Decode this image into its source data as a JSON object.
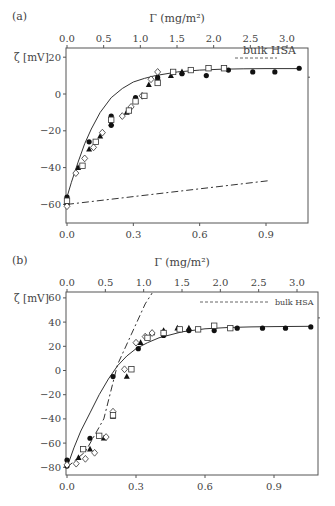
{
  "chart_data": [
    {
      "panel": "(a)",
      "type": "scatter",
      "xlabel_bottom": "",
      "xlabel_top": "Γ (mg/m²)",
      "ylabel": "ζ [mV]",
      "x_bottom_ticks": [
        "0.0",
        "0.3",
        "0.6",
        "0.9"
      ],
      "x_bottom_values": [
        0.0,
        0.3,
        0.6,
        0.9
      ],
      "x_top_ticks": [
        "0.0",
        "0.5",
        "1.0",
        "1.5",
        "2.0",
        "2.5",
        "3.0"
      ],
      "x_top_values": [
        0.0,
        0.5,
        1.0,
        1.5,
        2.0,
        2.5,
        3.0
      ],
      "y_ticks": [
        "20",
        "0",
        "−20",
        "−40",
        "−60"
      ],
      "y_values": [
        20,
        0,
        -20,
        -40,
        -60
      ],
      "xlim_bottom": [
        0,
        1.09
      ],
      "xlim_top": [
        0,
        3.3
      ],
      "ylim": [
        -70,
        25
      ],
      "legend": [
        {
          "label": "bulk HSA",
          "style": "dashed"
        }
      ],
      "series": [
        {
          "name": "filled-circle",
          "marker": "filled-circle",
          "x": [
            0.0,
            0.1,
            0.2,
            0.2,
            0.31,
            0.41,
            0.52,
            0.63,
            0.73,
            0.84,
            0.94,
            1.05
          ],
          "y": [
            -56,
            -26,
            -12,
            -17,
            -2,
            9,
            11,
            10,
            13,
            12,
            12,
            14
          ]
        },
        {
          "name": "filled-triangle",
          "marker": "filled-triangle",
          "x": [
            0.0,
            0.05,
            0.1,
            0.15,
            0.2,
            0.27,
            0.31,
            0.37,
            0.41,
            0.47,
            0.52
          ],
          "y": [
            -59,
            -40,
            -30,
            -23,
            -16,
            -10,
            -4,
            5,
            9,
            10,
            12
          ]
        },
        {
          "name": "open-diamond",
          "marker": "open-diamond",
          "x": [
            0.0,
            0.04,
            0.08,
            0.12,
            0.16,
            0.25,
            0.29,
            0.34,
            0.38,
            0.41
          ],
          "y": [
            -61,
            -43,
            -35,
            -29,
            -21,
            -12,
            -7,
            -1,
            8,
            12
          ]
        },
        {
          "name": "open-square",
          "marker": "open-square",
          "x": [
            0.0,
            0.07,
            0.13,
            0.2,
            0.28,
            0.31,
            0.35,
            0.41,
            0.48,
            0.56,
            0.64,
            0.71
          ],
          "y": [
            -58,
            -39,
            -26,
            -14,
            -9,
            -4,
            -1,
            6,
            12,
            13,
            14,
            14
          ]
        }
      ],
      "lines": [
        {
          "name": "model-fit",
          "style": "solid",
          "x": [
            0.0,
            0.02,
            0.05,
            0.08,
            0.11,
            0.15,
            0.2,
            0.25,
            0.3,
            0.35,
            0.4,
            0.5,
            0.6,
            0.7,
            0.8,
            0.9,
            1.05
          ],
          "y": [
            -56,
            -48,
            -37,
            -27,
            -19,
            -10,
            -2,
            3,
            6.5,
            8.5,
            10,
            12,
            13,
            13.5,
            13.7,
            13.8,
            13.8
          ]
        },
        {
          "name": "bulk-HSA-reference",
          "style": "dash-dot",
          "x": [
            0.0,
            0.92
          ],
          "y": [
            -60,
            -47
          ]
        }
      ]
    },
    {
      "panel": "(b)",
      "type": "scatter",
      "xlabel_top": "Γ (mg/m²)",
      "ylabel": "ζ [mV]",
      "x_bottom_ticks": [
        "0.0",
        "0.3",
        "0.6",
        "0.9"
      ],
      "x_bottom_values": [
        0.0,
        0.3,
        0.6,
        0.9
      ],
      "x_top_ticks": [
        "0.0",
        "0.5",
        "1.0",
        "1.5",
        "2.0",
        "2.5",
        "3.0"
      ],
      "x_top_values": [
        0.0,
        0.5,
        1.0,
        1.5,
        2.0,
        2.5,
        3.0
      ],
      "y_ticks": [
        "60",
        "40",
        "20",
        "0",
        "−20",
        "−40",
        "−60",
        "−80"
      ],
      "y_values": [
        60,
        40,
        20,
        0,
        -20,
        -40,
        -60,
        -80
      ],
      "xlim_bottom": [
        0,
        1.09
      ],
      "xlim_top": [
        0,
        3.3
      ],
      "ylim": [
        -87,
        65
      ],
      "legend": [
        {
          "label": "bulk HSA",
          "style": "dashed"
        }
      ],
      "series": [
        {
          "name": "filled-circle",
          "marker": "filled-circle",
          "x": [
            0.0,
            0.0,
            0.1,
            0.2,
            0.31,
            0.42,
            0.53,
            0.64,
            0.74,
            0.85,
            0.95,
            1.06
          ],
          "y": [
            -74,
            -79,
            -56,
            -5,
            18,
            29,
            33,
            33,
            35,
            35,
            35,
            36
          ]
        },
        {
          "name": "filled-triangle",
          "marker": "filled-triangle",
          "x": [
            0.05,
            0.1,
            0.16,
            0.2,
            0.26,
            0.32,
            0.37,
            0.42,
            0.48,
            0.53
          ],
          "y": [
            -72,
            -65,
            -56,
            -38,
            -5,
            23,
            31,
            33,
            35,
            35
          ]
        },
        {
          "name": "open-diamond",
          "marker": "open-diamond",
          "x": [
            0.0,
            0.04,
            0.08,
            0.12,
            0.17,
            0.2,
            0.25,
            0.3,
            0.34,
            0.37
          ],
          "y": [
            -78,
            -77,
            -73,
            -68,
            -55,
            -34,
            1,
            23,
            28,
            31
          ]
        },
        {
          "name": "open-square",
          "marker": "open-square",
          "x": [
            0.07,
            0.14,
            0.2,
            0.28,
            0.35,
            0.42,
            0.49,
            0.57,
            0.64,
            0.71
          ],
          "y": [
            -65,
            -54,
            -37,
            1,
            27,
            31,
            34,
            34,
            37,
            35
          ]
        }
      ],
      "lines": [
        {
          "name": "model-fit",
          "style": "solid",
          "x": [
            0.0,
            0.03,
            0.06,
            0.1,
            0.14,
            0.18,
            0.22,
            0.26,
            0.3,
            0.35,
            0.4,
            0.5,
            0.6,
            0.7,
            0.8,
            0.9,
            1.06
          ],
          "y": [
            -80,
            -64,
            -50,
            -35,
            -20,
            -7,
            4,
            12,
            18,
            23,
            27,
            32,
            34.5,
            35.5,
            36,
            36.3,
            36.5
          ]
        },
        {
          "name": "bulk-HSA-reference",
          "style": "dash-dot",
          "x": [
            0.0,
            0.08,
            0.16,
            0.22,
            0.28,
            0.34,
            0.37
          ],
          "y": [
            -80,
            -67,
            -40,
            5,
            30,
            55,
            64
          ]
        }
      ]
    }
  ],
  "panels": [
    {
      "label": "(a)",
      "frame": {
        "left": 66,
        "top": 48,
        "right": 308,
        "bottom": 223
      },
      "top_axis_px": {
        "x0": 67,
        "x3": 287
      },
      "bottom_axis_px": {
        "x0": 67,
        "x09": 266
      },
      "y_axis_px": {
        "y_at_zero": 94,
        "px_per_20": 36.8
      },
      "legend_box": {
        "x1": 235,
        "x2": 277,
        "y": 58,
        "text_x": 243,
        "text_y": 54,
        "size": 11
      }
    },
    {
      "label": "(b)",
      "frame": {
        "left": 66,
        "top": 292,
        "right": 318,
        "bottom": 475
      },
      "top_axis_px": {
        "x0": 67,
        "x3": 297
      },
      "bottom_axis_px": {
        "x0": 67,
        "x09": 274
      },
      "y_axis_px": {
        "y_at_zero": 370.5,
        "px_per_20": 24.2
      },
      "legend_box": {
        "x1": 200,
        "x2": 268,
        "y": 302,
        "text_x": 275,
        "text_y": 305,
        "size": 8
      }
    }
  ]
}
